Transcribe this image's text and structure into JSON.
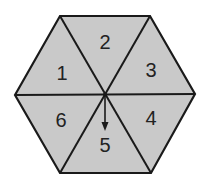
{
  "diagram": {
    "type": "hexagonal spinner",
    "fill_color": "#c9c9c9",
    "stroke_color": "#1a1a1a",
    "sections": [
      {
        "label": "1"
      },
      {
        "label": "2"
      },
      {
        "label": "3"
      },
      {
        "label": "4"
      },
      {
        "label": "5"
      },
      {
        "label": "6"
      }
    ],
    "pointer": {
      "points_to": "5"
    }
  }
}
